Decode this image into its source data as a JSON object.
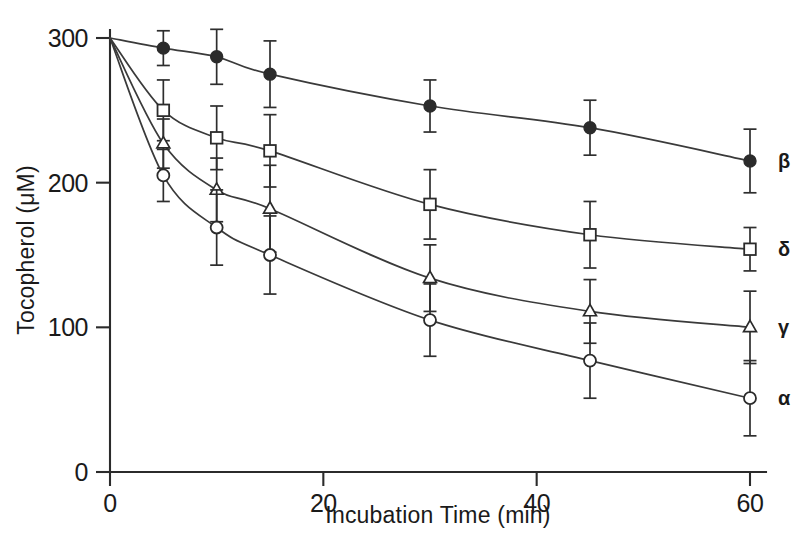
{
  "figure": {
    "background_color": "#ffffff",
    "ink_color": "#2b2b2b"
  },
  "axes": {
    "x_title": "Incubation Time (min)",
    "y_title": "Tocopherol (μM)",
    "x_ticks": [
      "0",
      "20",
      "40",
      "60"
    ],
    "y_ticks": [
      "0",
      "100",
      "200",
      "300"
    ],
    "x_origin_label": "0",
    "y_origin_label": "0"
  },
  "series_labels": {
    "beta": "β",
    "delta": "δ",
    "gamma": "γ",
    "alpha": "α"
  },
  "chart_data": {
    "type": "line",
    "title": "",
    "subtitle": "",
    "xlabel": "Incubation Time (min)",
    "ylabel": "Tocopherol (μM)",
    "xlim": [
      0,
      60
    ],
    "ylim": [
      0,
      300
    ],
    "xticks": [
      0,
      20,
      40,
      60
    ],
    "yticks": [
      0,
      100,
      200,
      300
    ],
    "grid": false,
    "legend_position": "right-of-curve-ends",
    "error_bars": "symmetric-vertical-with-caps",
    "x": [
      0,
      5,
      10,
      15,
      30,
      45,
      60
    ],
    "series": [
      {
        "name": "β",
        "marker": "filled-circle",
        "values": [
          300,
          293,
          287,
          275,
          253,
          238,
          215
        ],
        "errors": [
          0,
          12,
          19,
          23,
          18,
          19,
          22
        ]
      },
      {
        "name": "δ",
        "marker": "open-square",
        "values": [
          300,
          250,
          231,
          222,
          185,
          164,
          154
        ],
        "errors": [
          0,
          21,
          22,
          25,
          24,
          23,
          15
        ]
      },
      {
        "name": "γ",
        "marker": "open-triangle",
        "values": [
          300,
          227,
          195,
          182,
          134,
          111,
          100
        ],
        "errors": [
          0,
          17,
          22,
          30,
          23,
          22,
          25
        ]
      },
      {
        "name": "α",
        "marker": "open-circle",
        "values": [
          300,
          205,
          169,
          150,
          105,
          77,
          51
        ],
        "errors": [
          0,
          18,
          26,
          27,
          25,
          26,
          26
        ]
      }
    ]
  }
}
